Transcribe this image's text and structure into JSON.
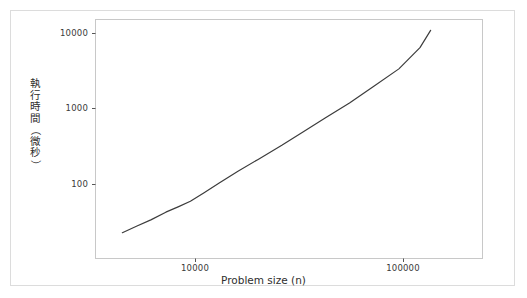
{
  "chart_data": {
    "type": "line",
    "title": "",
    "xlabel": "Problem size (n)",
    "ylabel": "執行時間（微秒）",
    "xscale": "log",
    "yscale": "log",
    "grid": false,
    "legend": null,
    "xlim": [
      3800,
      160000
    ],
    "ylim": [
      20,
      14000
    ],
    "xticks": [
      10000,
      100000
    ],
    "xtick_labels": [
      "10000",
      "100000"
    ],
    "yticks": [
      100,
      1000,
      10000
    ],
    "ytick_labels": [
      "100",
      "1000",
      "10000"
    ],
    "series": [
      {
        "name": "execution time",
        "color": "#3c3c3c",
        "x": [
          4450,
          5200,
          6100,
          7200,
          8300,
          9450,
          11000,
          13000,
          16000,
          20000,
          26000,
          33000,
          42000,
          55000,
          72000,
          95000,
          120000,
          135000
        ],
        "y": [
          23,
          28,
          34,
          43,
          51,
          60,
          78,
          105,
          150,
          215,
          330,
          500,
          760,
          1200,
          2000,
          3400,
          6500,
          11000
        ]
      }
    ]
  },
  "axes": {
    "x_title": "Problem size (n)",
    "y_title_chars": [
      "執",
      "行",
      "時",
      "間",
      "（",
      "微",
      "秒",
      "）"
    ],
    "x_tick_labels": [
      "10000",
      "100000"
    ],
    "y_tick_labels": [
      "10000",
      "1000",
      "100"
    ]
  },
  "colors": {
    "line": "#3c3c3c",
    "plot_border": "#c8c8c8",
    "outer_border": "#dcdcdc",
    "text": "#2e2e2e",
    "background": "#ffffff"
  }
}
